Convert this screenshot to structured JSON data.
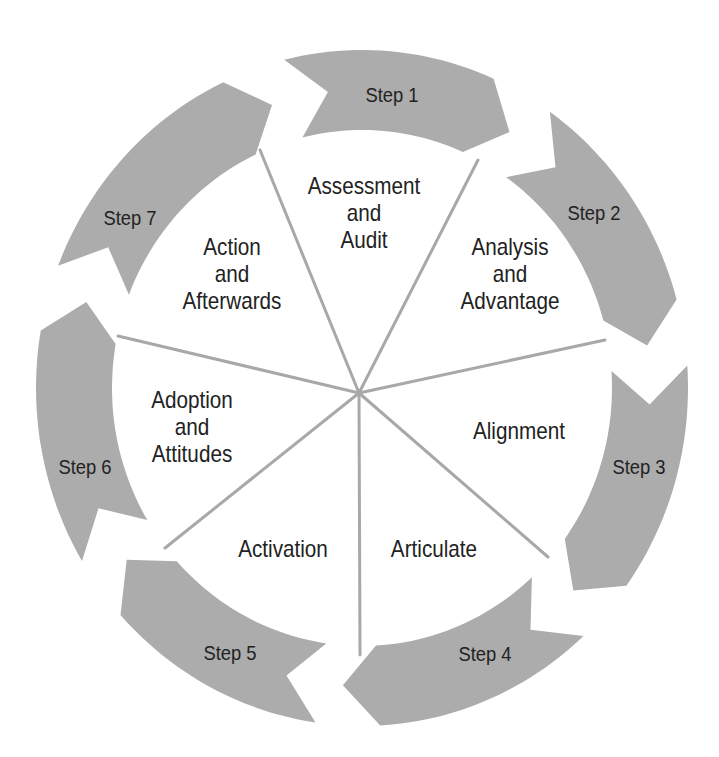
{
  "diagram": {
    "title": "",
    "colors": {
      "arrow_fill": "#acacac",
      "spoke": "#a8a8a8",
      "text": "#222222",
      "background": "#ffffff"
    },
    "steps": [
      {
        "label": "Step 1"
      },
      {
        "label": "Step 2"
      },
      {
        "label": "Step 3"
      },
      {
        "label": "Step 4"
      },
      {
        "label": "Step 5"
      },
      {
        "label": "Step 6"
      },
      {
        "label": "Step 7"
      }
    ],
    "sectors": [
      {
        "lines": [
          "Assessment",
          "and",
          "Audit"
        ]
      },
      {
        "lines": [
          "Analysis",
          "and",
          "Advantage"
        ]
      },
      {
        "lines": [
          "Alignment"
        ]
      },
      {
        "lines": [
          "Articulate"
        ]
      },
      {
        "lines": [
          "Activation"
        ]
      },
      {
        "lines": [
          "Adoption",
          "and",
          "Attitudes"
        ]
      },
      {
        "lines": [
          "Action",
          "and",
          "Afterwards"
        ]
      }
    ]
  }
}
